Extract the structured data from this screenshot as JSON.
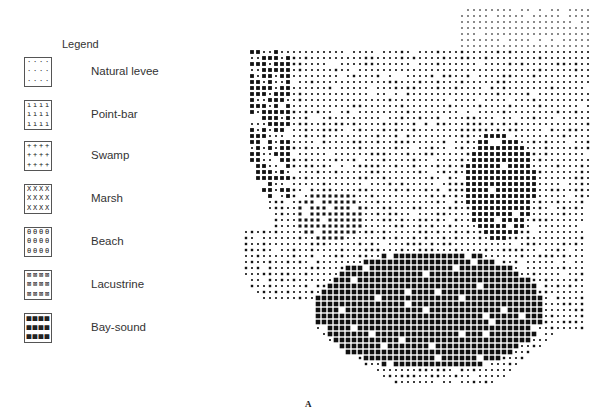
{
  "legend": {
    "title": "Legend",
    "items": [
      {
        "label": "Natural levee",
        "symbol": "dot-sparse",
        "glyph": "·",
        "top": 57
      },
      {
        "label": "Point-bar",
        "symbol": "tick",
        "glyph": "ı",
        "top": 100
      },
      {
        "label": "Swamp",
        "symbol": "plus",
        "glyph": "+",
        "top": 141
      },
      {
        "label": "Marsh",
        "symbol": "x",
        "glyph": "X",
        "top": 184
      },
      {
        "label": "Beach",
        "symbol": "theta",
        "glyph": "θ",
        "top": 227
      },
      {
        "label": "Lacustrine",
        "symbol": "crossed-square",
        "glyph": "⊠",
        "top": 270
      },
      {
        "label": "Bay-sound",
        "symbol": "solid-square",
        "glyph": "■",
        "top": 313
      }
    ]
  },
  "map": {
    "description": "Grid map of depositional environments (computer-printed symbol map)",
    "ink_color": "#111111",
    "cell_px": 6,
    "regions": [
      {
        "env": "Natural levee",
        "level": 1,
        "note": "top-right lobe and northern plain"
      },
      {
        "env": "Point-bar",
        "level": 2,
        "note": "central-north belt"
      },
      {
        "env": "Swamp",
        "level": 3,
        "note": "western and central patches"
      },
      {
        "env": "Marsh",
        "level": 4,
        "note": "central transitional zone"
      },
      {
        "env": "Beach",
        "level": 4,
        "note": "scattered"
      },
      {
        "env": "Lacustrine",
        "level": 5,
        "note": "east-central patch"
      },
      {
        "env": "Bay-sound",
        "level": 6,
        "note": "large southern body"
      }
    ]
  },
  "caption": "A"
}
